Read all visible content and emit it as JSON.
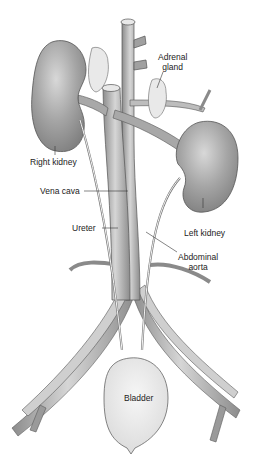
{
  "diagram": {
    "type": "anatomical-illustration",
    "labels": [
      {
        "id": "adrenal-gland",
        "text_lines": [
          "Adrenal",
          "gland"
        ]
      },
      {
        "id": "right-kidney",
        "text_lines": [
          "Right kidney"
        ]
      },
      {
        "id": "vena-cava",
        "text_lines": [
          "Vena cava"
        ]
      },
      {
        "id": "left-kidney",
        "text_lines": [
          "Left kidney"
        ]
      },
      {
        "id": "ureter",
        "text_lines": [
          "Ureter"
        ]
      },
      {
        "id": "abdominal-aorta",
        "text_lines": [
          "Abdominal",
          "aorta"
        ]
      },
      {
        "id": "bladder",
        "text_lines": [
          "Bladder"
        ]
      }
    ],
    "colors": {
      "organ_dark": "#8a8a8a",
      "organ_light": "#d0d0d0",
      "vessel": "#a8a8a8",
      "vessel_light": "#e2e2e2",
      "bladder": "#ededed",
      "outline": "#555555",
      "text": "#222222"
    }
  }
}
